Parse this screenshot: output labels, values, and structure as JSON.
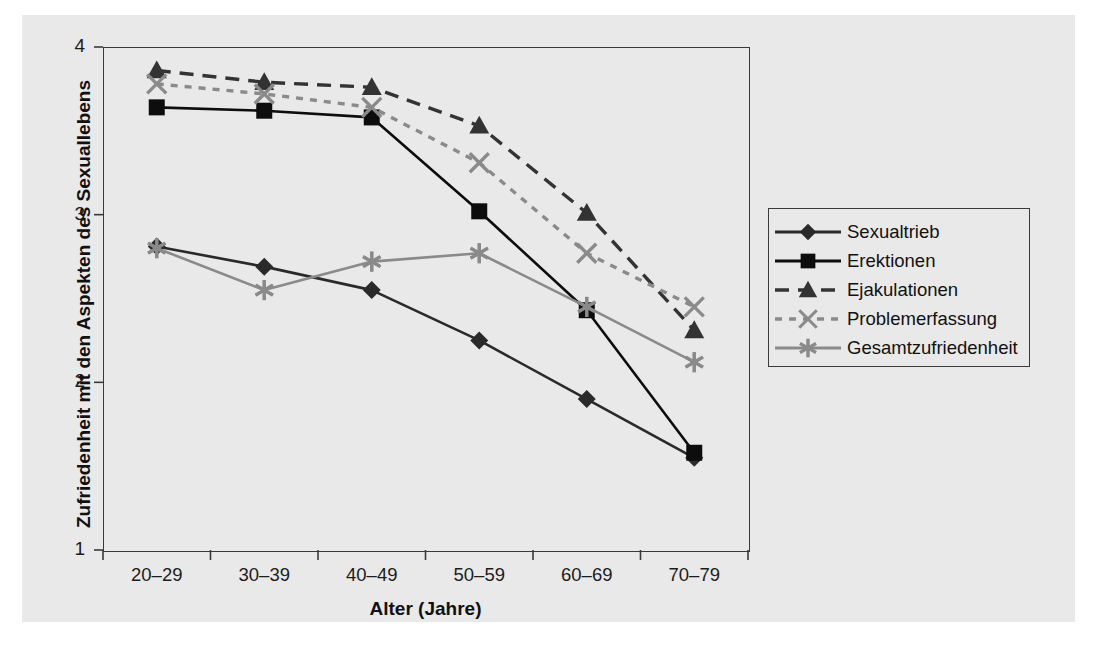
{
  "chart_data": {
    "type": "line",
    "title": "",
    "xlabel": "Alter (Jahre)",
    "ylabel": "Zufriedenheit mit den Aspekten des Sexuallebens",
    "categories": [
      "20–29",
      "30–39",
      "40–49",
      "50–59",
      "60–69",
      "70–79"
    ],
    "ylim": [
      1,
      4
    ],
    "yticks": [
      1,
      2,
      3,
      4
    ],
    "ytick_labels": [
      "1",
      "2",
      "3",
      "4"
    ],
    "grid": false,
    "legend_position": "right",
    "series": [
      {
        "name": "Sexualtrieb",
        "marker": "diamond",
        "line_style": "solid",
        "color": "#2a2a2a",
        "values": [
          2.81,
          2.69,
          2.55,
          2.25,
          1.9,
          1.55
        ]
      },
      {
        "name": "Erektionen",
        "marker": "square",
        "line_style": "solid",
        "color": "#0d0d0d",
        "values": [
          3.64,
          3.62,
          3.58,
          3.02,
          2.43,
          1.58
        ]
      },
      {
        "name": "Ejakulationen",
        "marker": "triangle",
        "line_style": "dashed",
        "color": "#333333",
        "values": [
          3.86,
          3.79,
          3.76,
          3.53,
          3.01,
          2.31
        ]
      },
      {
        "name": "Problemerfassung",
        "marker": "cross-x",
        "line_style": "dotted",
        "color": "#8a8a8a",
        "values": [
          3.78,
          3.72,
          3.64,
          3.31,
          2.77,
          2.45
        ]
      },
      {
        "name": "Gesamtzufriedenheit",
        "marker": "asterisk",
        "line_style": "solid",
        "color": "#8a8a8a",
        "values": [
          2.8,
          2.55,
          2.72,
          2.77,
          2.45,
          2.12
        ]
      }
    ]
  },
  "axes": {
    "y_title": "Zufriedenheit mit den Aspekten des Sexuallebens",
    "x_title": "Alter (Jahre)",
    "y_labels": [
      "4",
      "3",
      "2",
      "1"
    ],
    "x_labels": [
      "20–29",
      "30–39",
      "40–49",
      "50–59",
      "60–69",
      "70–79"
    ]
  },
  "legend": {
    "items": [
      {
        "label": "Sexualtrieb",
        "marker": "diamond-marker"
      },
      {
        "label": "Erektionen",
        "marker": "square-marker"
      },
      {
        "label": "Ejakulationen",
        "marker": "triangle-marker"
      },
      {
        "label": "Problemerfassung",
        "marker": "cross-x-marker"
      },
      {
        "label": "Gesamtzufriedenheit",
        "marker": "asterisk-marker"
      }
    ]
  },
  "colors": {
    "page_background": "#ffffff",
    "panel_background": "#e9e9e9",
    "axis": "#3a3a3a",
    "dark_series": "#1a1a1a",
    "gray_series": "#8a8a8a"
  }
}
